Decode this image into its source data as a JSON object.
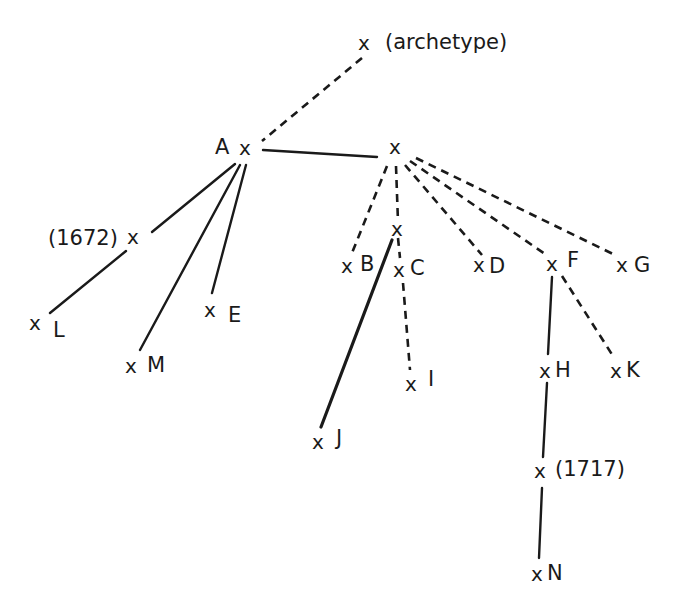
{
  "diagram": {
    "type": "stemma codicum",
    "nodes": [
      {
        "id": "archetype",
        "mark": "x",
        "label": "(archetype)",
        "x": 366,
        "y": 47
      },
      {
        "id": "A",
        "mark": "x",
        "label": "A",
        "x": 247,
        "y": 150
      },
      {
        "id": "hyp1",
        "mark": "x",
        "label": "",
        "x": 397,
        "y": 150
      },
      {
        "id": "1672",
        "mark": "x",
        "label": "(1672)",
        "x": 135,
        "y": 240
      },
      {
        "id": "L",
        "mark": "x",
        "label": "L",
        "x": 35,
        "y": 325
      },
      {
        "id": "M",
        "mark": "x",
        "label": "M",
        "x": 132,
        "y": 367
      },
      {
        "id": "E",
        "mark": "x",
        "label": "E",
        "x": 212,
        "y": 311
      },
      {
        "id": "hyp2",
        "mark": "x",
        "label": "",
        "x": 398,
        "y": 230
      },
      {
        "id": "B",
        "mark": "x",
        "label": "B",
        "x": 349,
        "y": 265
      },
      {
        "id": "C",
        "mark": "x",
        "label": "C",
        "x": 400,
        "y": 270
      },
      {
        "id": "D",
        "mark": "x",
        "label": "D",
        "x": 480,
        "y": 265
      },
      {
        "id": "F",
        "mark": "x",
        "label": "F",
        "x": 553,
        "y": 262
      },
      {
        "id": "G",
        "mark": "x",
        "label": "G",
        "x": 624,
        "y": 265
      },
      {
        "id": "I",
        "mark": "x",
        "label": "I",
        "x": 412,
        "y": 383
      },
      {
        "id": "J",
        "mark": "x",
        "label": "J",
        "x": 320,
        "y": 442
      },
      {
        "id": "H",
        "mark": "x",
        "label": "H",
        "x": 546,
        "y": 370
      },
      {
        "id": "K",
        "mark": "x",
        "label": "K",
        "x": 617,
        "y": 370
      },
      {
        "id": "1717",
        "mark": "x",
        "label": "(1717)",
        "x": 541,
        "y": 471
      },
      {
        "id": "N",
        "mark": "x",
        "label": "N",
        "x": 538,
        "y": 575
      }
    ],
    "edges": [
      {
        "from": "archetype",
        "to": "A",
        "style": "dashed"
      },
      {
        "from": "A",
        "to": "hyp1",
        "style": "solid"
      },
      {
        "from": "A",
        "to": "1672",
        "style": "solid"
      },
      {
        "from": "1672",
        "to": "L",
        "style": "solid"
      },
      {
        "from": "A",
        "to": "M",
        "style": "solid"
      },
      {
        "from": "A",
        "to": "E",
        "style": "solid"
      },
      {
        "from": "hyp1",
        "to": "B",
        "style": "dashed"
      },
      {
        "from": "hyp1",
        "to": "hyp2",
        "style": "dashed"
      },
      {
        "from": "hyp1",
        "to": "D",
        "style": "dashed"
      },
      {
        "from": "hyp1",
        "to": "F",
        "style": "dashed"
      },
      {
        "from": "hyp1",
        "to": "G",
        "style": "dashed"
      },
      {
        "from": "hyp2",
        "to": "C",
        "style": "dashed"
      },
      {
        "from": "hyp2",
        "to": "J",
        "style": "solid"
      },
      {
        "from": "C",
        "to": "I",
        "style": "dashed"
      },
      {
        "from": "F",
        "to": "H",
        "style": "solid"
      },
      {
        "from": "F",
        "to": "K",
        "style": "dashed"
      },
      {
        "from": "H",
        "to": "1717",
        "style": "solid"
      },
      {
        "from": "1717",
        "to": "N",
        "style": "solid"
      }
    ]
  },
  "labels": {
    "archetype": "(archetype)",
    "A": "A",
    "d1672": "(1672)",
    "L": "L",
    "M": "M",
    "E": "E",
    "B": "B",
    "C": "C",
    "D": "D",
    "F": "F",
    "G": "G",
    "I": "I",
    "J": "J",
    "H": "H",
    "K": "K",
    "d1717": "(1717)",
    "N": "N",
    "mark": "x"
  }
}
